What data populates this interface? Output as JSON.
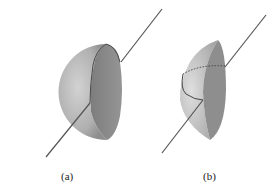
{
  "figure": {
    "panels": [
      {
        "id": "a",
        "label": "(a)",
        "description": "Sphere with a cut cavity and an axis line passing through"
      },
      {
        "id": "b",
        "label": "(b)",
        "description": "Hemispherical shell segment with a dotted and solid arc and an axis line passing through"
      }
    ]
  },
  "colors": {
    "sphere_light": "#d0d0d0",
    "sphere_dark": "#8a8a8a",
    "cut_face": "#8c8c8c",
    "line": "#555555"
  }
}
